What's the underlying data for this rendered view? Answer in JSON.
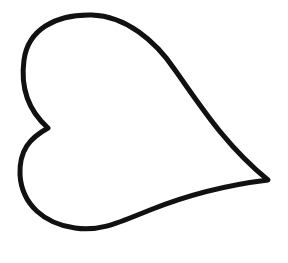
{
  "image": {
    "subject": "heart outline drawing",
    "style": "hand-drawn line art",
    "orientation": "rotated, tip pointing right",
    "colors": {
      "background": "#ffffff",
      "stroke": "#111111",
      "fill": "#ffffff"
    }
  }
}
